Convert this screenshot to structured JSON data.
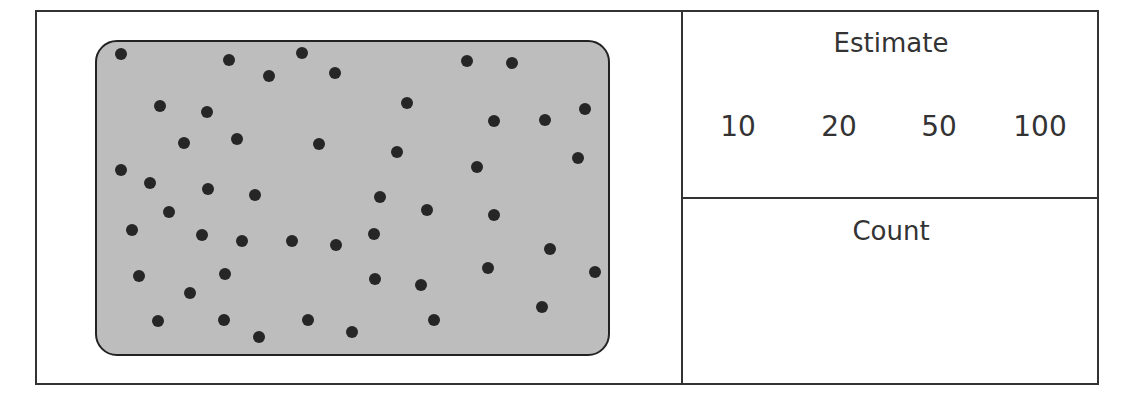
{
  "worksheet": {
    "estimate": {
      "title": "Estimate",
      "options": [
        "10",
        "20",
        "50",
        "100"
      ]
    },
    "count": {
      "title": "Count",
      "value": ""
    },
    "dots": {
      "fill_color": "#bdbdbd",
      "dot_color": "#262626",
      "total_visible": 51,
      "positions": [
        [
          121,
          54
        ],
        [
          229,
          60
        ],
        [
          302,
          53
        ],
        [
          269,
          76
        ],
        [
          335,
          73
        ],
        [
          467,
          61
        ],
        [
          512,
          63
        ],
        [
          160,
          106
        ],
        [
          207,
          112
        ],
        [
          407,
          103
        ],
        [
          494,
          121
        ],
        [
          545,
          120
        ],
        [
          585,
          109
        ],
        [
          184,
          143
        ],
        [
          237,
          139
        ],
        [
          319,
          144
        ],
        [
          397,
          152
        ],
        [
          578,
          158
        ],
        [
          477,
          167
        ],
        [
          121,
          170
        ],
        [
          150,
          183
        ],
        [
          208,
          189
        ],
        [
          255,
          195
        ],
        [
          380,
          197
        ],
        [
          169,
          212
        ],
        [
          427,
          210
        ],
        [
          494,
          215
        ],
        [
          132,
          230
        ],
        [
          202,
          235
        ],
        [
          242,
          241
        ],
        [
          292,
          241
        ],
        [
          336,
          245
        ],
        [
          374,
          234
        ],
        [
          550,
          249
        ],
        [
          139,
          276
        ],
        [
          225,
          274
        ],
        [
          375,
          279
        ],
        [
          421,
          285
        ],
        [
          488,
          268
        ],
        [
          595,
          272
        ],
        [
          190,
          293
        ],
        [
          158,
          321
        ],
        [
          224,
          320
        ],
        [
          259,
          337
        ],
        [
          308,
          320
        ],
        [
          352,
          332
        ],
        [
          434,
          320
        ],
        [
          542,
          307
        ]
      ]
    }
  }
}
